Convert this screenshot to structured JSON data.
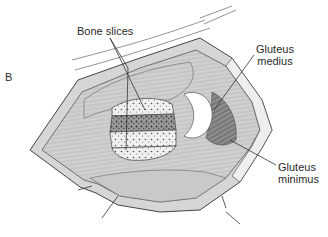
{
  "figure": {
    "panel_letter": "B",
    "labels": {
      "bone_slices": "Bone slices",
      "gluteus_medius_line1": "Gluteus",
      "gluteus_medius_line2": "medius",
      "gluteus_minimus_line1": "Gluteus",
      "gluteus_minimus_line2": "minimus"
    },
    "colors": {
      "background": "#ffffff",
      "ink": "#2a2a2a",
      "tissue_light": "#e6e6e6",
      "tissue_mid": "#bdbdbd",
      "tissue_dark": "#6f6f6f",
      "bone": "#f2f2f2",
      "bone_dark": "#8a8a8a"
    }
  }
}
